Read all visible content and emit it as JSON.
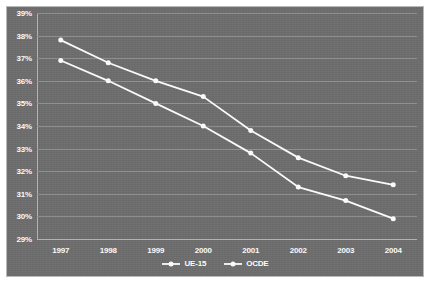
{
  "chart_data": {
    "type": "line",
    "title": "",
    "xlabel": "",
    "ylabel": "",
    "x": [
      "1997",
      "1998",
      "1999",
      "2000",
      "2001",
      "2002",
      "2003",
      "2004"
    ],
    "categories": [
      "1997",
      "1998",
      "1999",
      "2000",
      "2001",
      "2002",
      "2003",
      "2004"
    ],
    "series": [
      {
        "name": "UE-15",
        "color": "#ffffff",
        "marker": "circle",
        "values": [
          37.8,
          36.8,
          36.0,
          35.3,
          33.8,
          32.6,
          31.8,
          31.4
        ]
      },
      {
        "name": "OCDE",
        "color": "#ffffff",
        "marker": "circle",
        "values": [
          36.9,
          36.0,
          35.0,
          34.0,
          32.8,
          31.3,
          30.7,
          29.9
        ]
      }
    ],
    "ylim": [
      29,
      39
    ],
    "ytick_labels": [
      "39%",
      "38%",
      "37%",
      "36%",
      "35%",
      "34%",
      "33%",
      "32%",
      "31%",
      "30%",
      "29%"
    ],
    "ytick_values": [
      39,
      38,
      37,
      36,
      35,
      34,
      33,
      32,
      31,
      30,
      29
    ],
    "grid": true,
    "legend_position": "bottom",
    "background_color": "#6e6e6e",
    "gridline_color": "#909090",
    "axis_color": "#b4b4b4",
    "text_color": "#ffffff"
  },
  "legend": {
    "entries": [
      {
        "label": "UE-15"
      },
      {
        "label": "OCDE"
      }
    ]
  }
}
